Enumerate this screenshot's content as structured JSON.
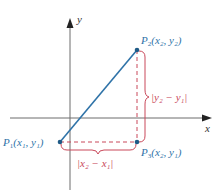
{
  "colors": {
    "axis": "#6d6d6d",
    "segment": "#2f73a8",
    "point": "#1f5a86",
    "dashed": "#c9485a",
    "brace": "#c9485a",
    "point_label": "#2f73a8",
    "distance_label": "#c9485a",
    "axis_label": "#333333"
  },
  "axes": {
    "x_label": "x",
    "y_label": "y"
  },
  "points": {
    "p1": {
      "name": "P",
      "sub": "1",
      "coords": "(x₁, y₁)"
    },
    "p2": {
      "name": "P",
      "sub": "2",
      "coords": "(x₂, y₂)"
    },
    "p3": {
      "name": "P",
      "sub": "3",
      "coords": "(x₂, y₁)"
    }
  },
  "distances": {
    "vertical": "|y₂ − y₁|",
    "horizontal": "|x₂ − x₁|"
  }
}
